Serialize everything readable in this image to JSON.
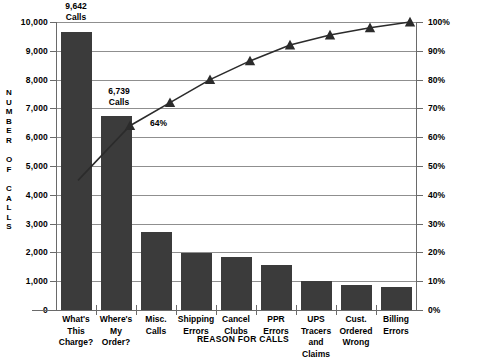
{
  "chart_data": {
    "type": "bar",
    "title": "",
    "xlabel": "REASON FOR CALLS",
    "ylabel": "NUMBER OF CALLS",
    "categories": [
      "What's This Charge?",
      "Where's My Order?",
      "Misc. Calls",
      "Shipping Errors",
      "Cancel Clubs",
      "PPR Errors",
      "UPS Tracers and Claims",
      "Cust. Ordered Wrong",
      "Billing Errors"
    ],
    "category_lines": [
      [
        "What's",
        "This",
        "Charge?"
      ],
      [
        "Where's",
        "My Order?"
      ],
      [
        "Misc.",
        "Calls"
      ],
      [
        "Shipping",
        "Errors"
      ],
      [
        "Cancel",
        "Clubs"
      ],
      [
        "PPR",
        "Errors"
      ],
      [
        "UPS",
        "Tracers",
        "and Claims"
      ],
      [
        "Cust.",
        "Ordered",
        "Wrong"
      ],
      [
        "Billing",
        "Errors"
      ]
    ],
    "values": [
      9642,
      6739,
      2700,
      1980,
      1830,
      1550,
      1000,
      860,
      800
    ],
    "cumulative_percent": [
      45,
      64,
      72,
      80,
      86.5,
      92,
      95.5,
      98,
      100
    ],
    "ylim": [
      0,
      10000
    ],
    "y2lim": [
      0,
      100
    ],
    "ytick_labels": [
      "10,000",
      "9,000",
      "8,000",
      "7,000",
      "6,000",
      "5,000",
      "4,000",
      "3,000",
      "2,000",
      "1,000",
      "0"
    ],
    "ytick_values": [
      10000,
      9000,
      8000,
      7000,
      6000,
      5000,
      4000,
      3000,
      2000,
      1000,
      0
    ],
    "y2tick_labels": [
      "100%",
      "90%",
      "80%",
      "70%",
      "60%",
      "50%",
      "40%",
      "30%",
      "20%",
      "10%",
      "0%"
    ],
    "y2tick_values": [
      100,
      90,
      80,
      70,
      60,
      50,
      40,
      30,
      20,
      10,
      0
    ],
    "grid": true,
    "legend": "none",
    "bar_color": "#3b3b3b",
    "line_color": "#2b2b2b",
    "annotations": [
      {
        "name": "bar-1-value-label",
        "text": "9,642\nCalls",
        "line1": "9,642",
        "line2": "Calls"
      },
      {
        "name": "bar-2-value-label",
        "text": "6,739\nCalls",
        "line1": "6,739",
        "line2": "Calls"
      },
      {
        "name": "cumulative-64-percent-label",
        "text": "64%"
      }
    ]
  },
  "labels": {
    "bar1_value": "9,642",
    "bar1_unit": "Calls",
    "bar2_value": "6,739",
    "bar2_unit": "Calls",
    "pct64": "64%",
    "y_axis_title_chars": [
      "N",
      "U",
      "M",
      "B",
      "E",
      "R",
      "",
      "O",
      "F",
      "",
      "C",
      "A",
      "L",
      "L",
      "S"
    ],
    "x_axis_title": "REASON FOR CALLS"
  }
}
